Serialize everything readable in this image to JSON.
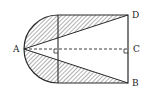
{
  "diagram": {
    "type": "geometry",
    "points": {
      "A": {
        "label": "A",
        "x": 24,
        "y": 49
      },
      "B": {
        "label": "B",
        "x": 128,
        "y": 83
      },
      "C": {
        "label": "C",
        "x": 128,
        "y": 49
      },
      "D": {
        "label": "D",
        "x": 128,
        "y": 15
      }
    },
    "labels": {
      "a": "A",
      "b": "B",
      "c": "C",
      "d": "D"
    },
    "colors": {
      "stroke": "#2a2a2a",
      "hatch": "#3a3a3a",
      "background": "#ffffff"
    }
  }
}
